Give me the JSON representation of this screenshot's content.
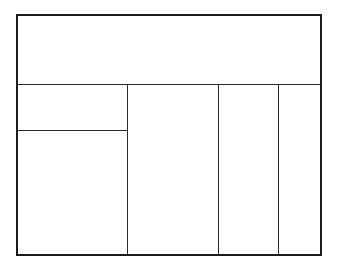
{
  "diagram": {
    "type": "layout-wireframe",
    "colors": {
      "background": "#ffffff",
      "lines": "#1a1a1a"
    },
    "regions": [
      {
        "id": "header",
        "label": ""
      },
      {
        "id": "left-top",
        "label": ""
      },
      {
        "id": "left-bottom",
        "label": ""
      },
      {
        "id": "column-2",
        "label": ""
      },
      {
        "id": "column-3",
        "label": ""
      },
      {
        "id": "column-4",
        "label": ""
      }
    ]
  }
}
